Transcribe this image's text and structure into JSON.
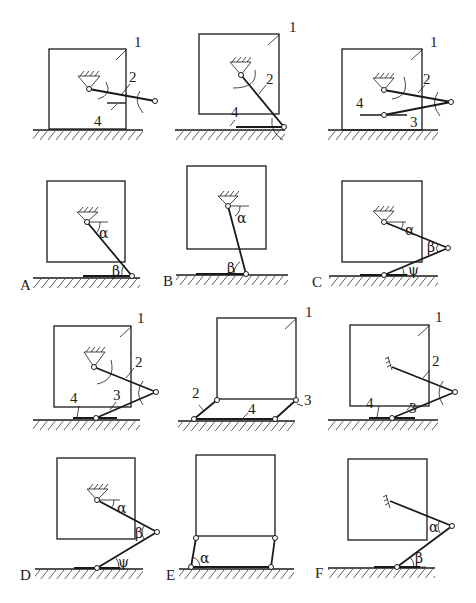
{
  "figure": {
    "part_labels": {
      "body": "1",
      "link2": "2",
      "link3": "3",
      "link4": "4"
    },
    "variant_labels": [
      "A",
      "B",
      "C",
      "D",
      "E",
      "F"
    ],
    "angle_labels": {
      "alpha": "α",
      "beta": "β",
      "psi": "ψ"
    }
  },
  "panels": {
    "A_top": {
      "labels": [
        "1",
        "2",
        "4"
      ]
    },
    "B_top": {
      "labels": [
        "1",
        "2",
        "4"
      ]
    },
    "C_top": {
      "labels": [
        "1",
        "2",
        "3",
        "4"
      ]
    },
    "A_bottom": {
      "variant": "A",
      "angles": [
        "α",
        "β"
      ]
    },
    "B_bottom": {
      "variant": "B",
      "angles": [
        "α",
        "β"
      ]
    },
    "C_bottom": {
      "variant": "C",
      "angles": [
        "α",
        "β",
        "ψ"
      ]
    },
    "D_top": {
      "labels": [
        "1",
        "2",
        "3",
        "4"
      ]
    },
    "E_top": {
      "labels": [
        "1",
        "2",
        "3",
        "4"
      ]
    },
    "F_top": {
      "labels": [
        "1",
        "2",
        "3",
        "4"
      ]
    },
    "D_bottom": {
      "variant": "D",
      "angles": [
        "α",
        "β",
        "ψ"
      ]
    },
    "E_bottom": {
      "variant": "E",
      "angles": [
        "α"
      ]
    },
    "F_bottom": {
      "variant": "F",
      "angles": [
        "α",
        "β"
      ]
    }
  }
}
